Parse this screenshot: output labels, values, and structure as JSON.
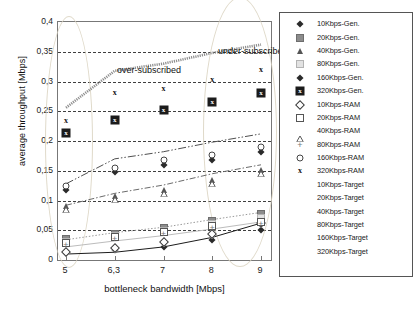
{
  "chart_data": {
    "type": "scatter",
    "title": "",
    "xlabel": "bottleneck bandwidth [Mbps]",
    "ylabel": "average throughput [Mbps]",
    "x": [
      5,
      6.3,
      7,
      8,
      9
    ],
    "xticklabels": [
      "5",
      "6,3",
      "7",
      "8",
      "9"
    ],
    "yticklabels": [
      "0,4",
      "0,35",
      "0,3",
      "0,25",
      "0,2",
      "0,15",
      "0,1",
      "0,05",
      "0"
    ],
    "ylim": [
      0,
      0.4
    ],
    "ytick_step": 0.05,
    "grid": "horizontal-dashed",
    "legend_position": "right-outside",
    "annotations": [
      {
        "text": "over-subscribed",
        "x": 5.0,
        "y": 0.352
      },
      {
        "text": "under-subscribed",
        "x": 7.6,
        "y": 0.385
      }
    ],
    "highlight_ellipses": [
      {
        "label": "over-subscribed-region",
        "cx": 5.05,
        "cy": 0.17
      },
      {
        "label": "under-subscribed-region",
        "cx": 8.5,
        "cy": 0.2
      }
    ],
    "series": [
      {
        "name": "10Kbps-Gen.",
        "marker": "diamond-filled",
        "values": [
          0.012,
          0.016,
          0.022,
          0.034,
          0.05
        ]
      },
      {
        "name": "20Kbps-Gen.",
        "marker": "square-filled",
        "values": [
          0.035,
          0.044,
          0.053,
          0.066,
          0.078
        ]
      },
      {
        "name": "40Kbps-Gen.",
        "marker": "triangle-filled",
        "values": [
          0.09,
          0.107,
          0.118,
          0.135,
          0.152
        ]
      },
      {
        "name": "80Kbps-Gen.",
        "marker": "square-light",
        "values": [
          0.03,
          0.04,
          0.048,
          0.06,
          0.07
        ]
      },
      {
        "name": "160Kbps-Gen.",
        "marker": "diamond-filled2",
        "values": [
          0.118,
          0.148,
          0.16,
          0.168,
          0.182
        ]
      },
      {
        "name": "320Kbps-Gen.",
        "marker": "boxed-x",
        "values": [
          0.213,
          0.236,
          0.252,
          0.266,
          0.281
        ]
      },
      {
        "name": "10Kbps-RAM",
        "marker": "diamond-open",
        "values": [
          0.013,
          0.02,
          0.03,
          0.043,
          0.062
        ]
      },
      {
        "name": "20Kbps-RAM",
        "marker": "square-open",
        "values": [
          0.028,
          0.038,
          0.047,
          0.057,
          0.064
        ]
      },
      {
        "name": "40Kbps-RAM",
        "marker": "triangle-open",
        "values": [
          0.098,
          0.115,
          0.125,
          0.142,
          0.158
        ]
      },
      {
        "name": "80Kbps-RAM",
        "marker": "plus",
        "values": [
          0.026,
          0.035,
          0.044,
          0.053,
          0.061
        ]
      },
      {
        "name": "160Kbps-RAM",
        "marker": "circle-open",
        "values": [
          0.125,
          0.155,
          0.168,
          0.176,
          0.19
        ]
      },
      {
        "name": "320Kbps-RAM",
        "marker": "x",
        "values": [
          0.233,
          0.28,
          0.288,
          0.302,
          0.32
        ]
      }
    ],
    "target_lines": [
      {
        "name": "10Kbps-Target",
        "style": "solid",
        "values": [
          0.01,
          0.013,
          0.022,
          0.038,
          0.062
        ]
      },
      {
        "name": "20Kbps-Target",
        "style": "light-solid",
        "values": [
          0.022,
          0.032,
          0.041,
          0.052,
          0.064
        ]
      },
      {
        "name": "40Kbps-Target",
        "style": "dotted",
        "values": [
          0.034,
          0.046,
          0.055,
          0.068,
          0.08
        ]
      },
      {
        "name": "80Kbps-Target",
        "style": "dashdot",
        "values": [
          0.092,
          0.112,
          0.126,
          0.145,
          0.16
        ]
      },
      {
        "name": "160Kbps-Target",
        "style": "longdashdot",
        "values": [
          0.128,
          0.17,
          0.182,
          0.198,
          0.212
        ]
      },
      {
        "name": "320Kbps-Target",
        "style": "thick-dotted",
        "values": [
          0.256,
          0.318,
          0.33,
          0.348,
          0.362
        ]
      }
    ]
  },
  "legend": {
    "entries": [
      {
        "label": "10Kbps-Gen.",
        "symbol": "diamond-filled"
      },
      {
        "label": "20Kbps-Gen.",
        "symbol": "square-filled"
      },
      {
        "label": "40Kbps-Gen.",
        "symbol": "triangle-filled"
      },
      {
        "label": "80Kbps-Gen.",
        "symbol": "square-light"
      },
      {
        "label": "160Kbps-Gen.",
        "symbol": "diamond-filled2"
      },
      {
        "label": "320Kbps-Gen.",
        "symbol": "boxed-x"
      },
      {
        "label": "10Kbps-RAM",
        "symbol": "diamond-open"
      },
      {
        "label": "20Kbps-RAM",
        "symbol": "square-open"
      },
      {
        "label": "40Kbps-RAM",
        "symbol": "triangle-open"
      },
      {
        "label": "80Kbps-RAM",
        "symbol": "plus"
      },
      {
        "label": "160Kbps-RAM",
        "symbol": "circle-open"
      },
      {
        "label": "320Kbps-RAM",
        "symbol": "x"
      },
      {
        "label": "10Kbps-Target",
        "symbol": "line-solid"
      },
      {
        "label": "20Kbps-Target",
        "symbol": "line-light-solid"
      },
      {
        "label": "40Kbps-Target",
        "symbol": "line-dotted"
      },
      {
        "label": "80Kbps-Target",
        "symbol": "line-dashdot"
      },
      {
        "label": "160Kbps-Target",
        "symbol": "line-longdashdot"
      },
      {
        "label": "320Kbps-Target",
        "symbol": "line-thick-dotted"
      }
    ]
  },
  "caption": {
    "text": ""
  },
  "colors": {
    "grid": "#2b2b2b",
    "frame": "#777777",
    "ellipse": "#d9d2bf",
    "marker_dark": "#2a2a2a",
    "marker_mid": "#8c8c8c",
    "marker_light": "#e2e2e2",
    "target_320": "#8e8e8e"
  }
}
